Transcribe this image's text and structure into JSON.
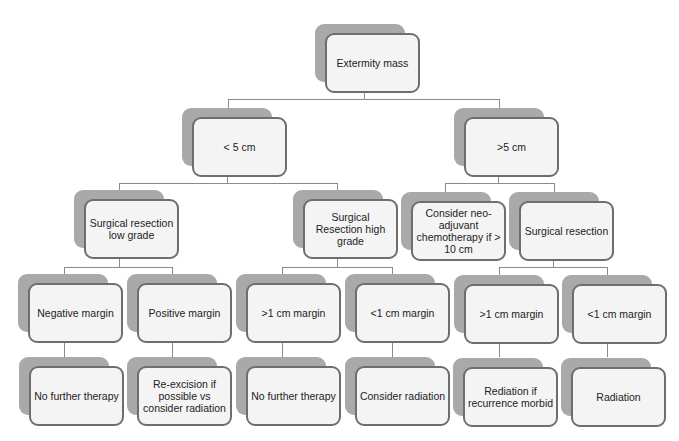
{
  "diagram": {
    "type": "flowchart-tree",
    "colors": {
      "box_fill": "#f4f4f4",
      "box_border": "#6e6e6e",
      "shadow": "#a9a9a9",
      "connector": "#8a8a8a"
    },
    "nodes": {
      "root": {
        "label": "Extermity mass"
      },
      "lt5": {
        "label": "< 5 cm"
      },
      "gt5": {
        "label": ">5 cm"
      },
      "sr_low": {
        "label": "Surgical resection low grade"
      },
      "sr_high": {
        "label": "Surgical Resection high grade"
      },
      "neoadj": {
        "label": "Consider neo-adjuvant chemotherapy if > 10 cm"
      },
      "sr_right": {
        "label": "Surgical resection"
      },
      "neg_margin": {
        "label": "Negative margin"
      },
      "pos_margin": {
        "label": "Positive margin"
      },
      "high_gt1": {
        "label": ">1 cm margin"
      },
      "high_lt1": {
        "label": "<1 cm margin"
      },
      "right_gt1": {
        "label": ">1 cm margin"
      },
      "right_lt1": {
        "label": "<1 cm margin"
      },
      "no_further_1": {
        "label": "No further therapy"
      },
      "reexcision": {
        "label": "Re-excision if possible vs consider radiation"
      },
      "no_further_2": {
        "label": "No further therapy"
      },
      "consider_rad": {
        "label": "Consider radiation"
      },
      "rediation_morbid": {
        "label": "Rediation if recurrence morbid"
      },
      "radiation": {
        "label": "Radiation"
      }
    },
    "edges": [
      [
        "root",
        "lt5"
      ],
      [
        "root",
        "gt5"
      ],
      [
        "lt5",
        "sr_low"
      ],
      [
        "lt5",
        "sr_high"
      ],
      [
        "gt5",
        "neoadj"
      ],
      [
        "gt5",
        "sr_right"
      ],
      [
        "sr_low",
        "neg_margin"
      ],
      [
        "sr_low",
        "pos_margin"
      ],
      [
        "sr_high",
        "high_gt1"
      ],
      [
        "sr_high",
        "high_lt1"
      ],
      [
        "sr_right",
        "right_gt1"
      ],
      [
        "sr_right",
        "right_lt1"
      ],
      [
        "neg_margin",
        "no_further_1"
      ],
      [
        "pos_margin",
        "reexcision"
      ],
      [
        "high_gt1",
        "no_further_2"
      ],
      [
        "high_lt1",
        "consider_rad"
      ],
      [
        "right_gt1",
        "rediation_morbid"
      ],
      [
        "right_lt1",
        "radiation"
      ]
    ]
  }
}
